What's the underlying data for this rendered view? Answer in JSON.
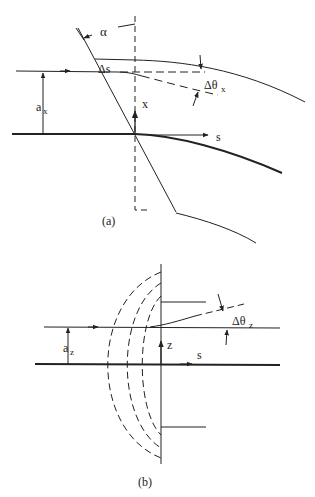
{
  "figure": {
    "panel_a": {
      "caption": "(a)",
      "labels": {
        "alpha": "α",
        "delta_s": "Δs",
        "delta_theta_x": "Δθ",
        "delta_theta_x_sub": "x",
        "a_x": "a",
        "a_x_sub": "x",
        "x_axis": "x",
        "s_axis": "s"
      }
    },
    "panel_b": {
      "caption": "(b)",
      "labels": {
        "delta_theta_z": "Δθ",
        "delta_theta_z_sub": "z",
        "a_z": "a",
        "a_z_sub": "z",
        "z_axis": "z",
        "s_axis": "s"
      }
    },
    "colors": {
      "line": "#222222",
      "background": "#ffffff"
    }
  }
}
